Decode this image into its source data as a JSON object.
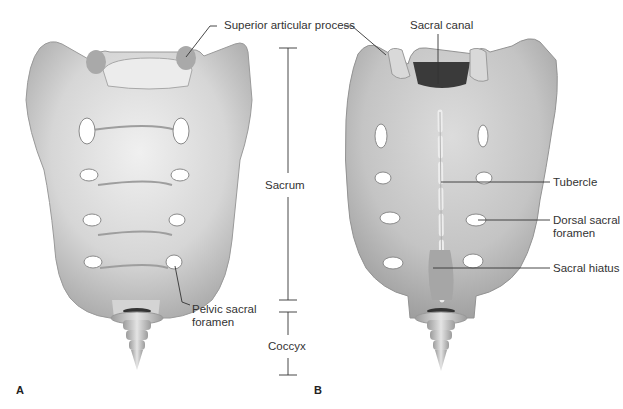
{
  "figure": {
    "panels": [
      {
        "id": "A",
        "label": "A",
        "view": "anterior (pelvic) view"
      },
      {
        "id": "B",
        "label": "B",
        "view": "posterior (dorsal) view"
      }
    ],
    "labels": {
      "superior_articular_process": "Superior articular process",
      "sacral_canal": "Sacral canal",
      "sacrum": "Sacrum",
      "coccyx": "Coccyx",
      "pelvic_sacral_foramen_line1": "Pelvic sacral",
      "pelvic_sacral_foramen_line2": "foramen",
      "tubercle": "Tubercle",
      "dorsal_sacral_foramen_line1": "Dorsal sacral",
      "dorsal_sacral_foramen_line2": "foramen",
      "sacral_hiatus": "Sacral hiatus"
    },
    "colors": {
      "bone_light": "#e6e6e6",
      "bone_mid": "#c9c9c9",
      "bone_dark": "#8f8f8f",
      "foramen": "#ffffff",
      "canal": "#3a3a3a",
      "leader_line": "#333333",
      "background": "#ffffff"
    }
  }
}
